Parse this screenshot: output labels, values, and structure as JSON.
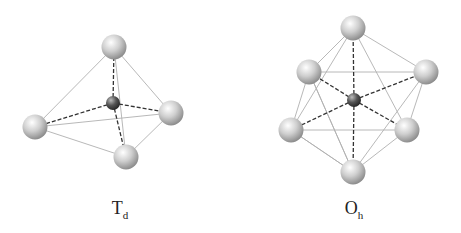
{
  "figures": [
    {
      "id": "tetrahedral",
      "label_main": "T",
      "label_sub": "d",
      "ligand_count": 4
    },
    {
      "id": "octahedral",
      "label_main": "O",
      "label_sub": "h",
      "ligand_count": 6
    }
  ],
  "colors": {
    "ligand": "#c8c8c8",
    "center": "#444444",
    "edge": "#b0b0b0",
    "bond": "#333333"
  }
}
